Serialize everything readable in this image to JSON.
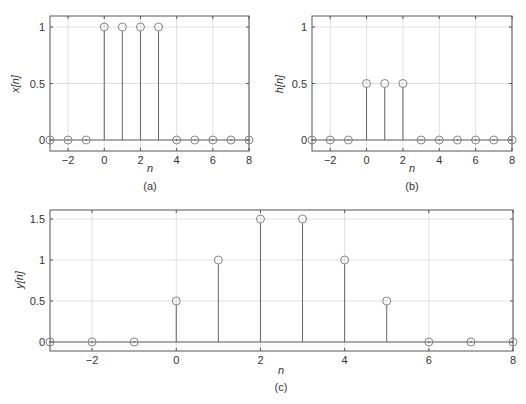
{
  "chart_data": [
    {
      "type": "stem",
      "id": "a",
      "caption": "(a)",
      "xlabel": "n",
      "ylabel": "x[n]",
      "x": [
        -3,
        -2,
        -1,
        0,
        1,
        2,
        3,
        4,
        5,
        6,
        7,
        8
      ],
      "values": [
        0,
        0,
        0,
        1,
        1,
        1,
        1,
        0,
        0,
        0,
        0,
        0
      ],
      "xlim": [
        -3,
        8
      ],
      "ylim": [
        -0.1,
        1.1
      ],
      "xticks": [
        -2,
        0,
        2,
        4,
        6,
        8
      ],
      "yticks": [
        0,
        0.5,
        1
      ],
      "xtick_labels": [
        "−2",
        "0",
        "2",
        "4",
        "6",
        "8"
      ],
      "ytick_labels": [
        "0",
        "0.5",
        "1"
      ],
      "grid": true
    },
    {
      "type": "stem",
      "id": "b",
      "caption": "(b)",
      "xlabel": "n",
      "ylabel": "h[n]",
      "x": [
        -3,
        -2,
        -1,
        0,
        1,
        2,
        3,
        4,
        5,
        6,
        7,
        8
      ],
      "values": [
        0,
        0,
        0,
        0.5,
        0.5,
        0.5,
        0,
        0,
        0,
        0,
        0,
        0
      ],
      "xlim": [
        -3,
        8
      ],
      "ylim": [
        -0.1,
        1.1
      ],
      "xticks": [
        -2,
        0,
        2,
        4,
        6,
        8
      ],
      "yticks": [
        0,
        0.5,
        1
      ],
      "xtick_labels": [
        "−2",
        "0",
        "2",
        "4",
        "6",
        "8"
      ],
      "ytick_labels": [
        "0",
        "0.5",
        "1"
      ],
      "grid": true
    },
    {
      "type": "stem",
      "id": "c",
      "caption": "(c)",
      "xlabel": "n",
      "ylabel": "y[n]",
      "x": [
        -3,
        -2,
        -1,
        0,
        1,
        2,
        3,
        4,
        5,
        6,
        7,
        8
      ],
      "values": [
        0,
        0,
        0,
        0.5,
        1,
        1.5,
        1.5,
        1,
        0.5,
        0,
        0,
        0
      ],
      "xlim": [
        -3,
        8
      ],
      "ylim": [
        -0.1,
        1.6
      ],
      "xticks": [
        -2,
        0,
        2,
        4,
        6,
        8
      ],
      "yticks": [
        0,
        0.5,
        1,
        1.5
      ],
      "xtick_labels": [
        "−2",
        "0",
        "2",
        "4",
        "6",
        "8"
      ],
      "ytick_labels": [
        "0",
        "0.5",
        "1",
        "1.5"
      ],
      "grid": true
    }
  ],
  "panels": {
    "a": {
      "caption": "(a)",
      "xlabel": "n",
      "ylabel": "x[n]"
    },
    "b": {
      "caption": "(b)",
      "xlabel": "n",
      "ylabel": "h[n]"
    },
    "c": {
      "caption": "(c)",
      "xlabel": "n",
      "ylabel": "y[n]"
    }
  },
  "colors": {
    "axis": "#555555",
    "grid": "#d8d8d8",
    "stem": "#666666",
    "marker": "#777777",
    "text": "#333333"
  }
}
